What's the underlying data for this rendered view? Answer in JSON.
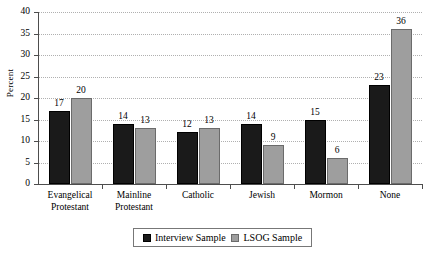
{
  "chart_data": {
    "type": "bar",
    "title": "",
    "xlabel": "",
    "ylabel": "Percent",
    "ylim": [
      0,
      40
    ],
    "ytick_step": 5,
    "yticks": [
      0,
      5,
      10,
      15,
      20,
      25,
      30,
      35,
      40
    ],
    "grid": true,
    "legend_position": "bottom",
    "categories": [
      "Evangelical\nProtestant",
      "Mainline\nProtestant",
      "Catholic",
      "Jewish",
      "Mormon",
      "None"
    ],
    "series": [
      {
        "name": "Interview Sample",
        "color": "#1a1a1a",
        "values": [
          17,
          14,
          12,
          14,
          15,
          23
        ]
      },
      {
        "name": "LSOG Sample",
        "color": "#9e9e9e",
        "values": [
          20,
          13,
          13,
          9,
          6,
          36
        ]
      }
    ]
  },
  "legend": {
    "items": [
      {
        "label": "Interview Sample",
        "swatch": "black-square-swatch"
      },
      {
        "label": "LSOG Sample",
        "swatch": "gray-square-swatch"
      }
    ]
  }
}
